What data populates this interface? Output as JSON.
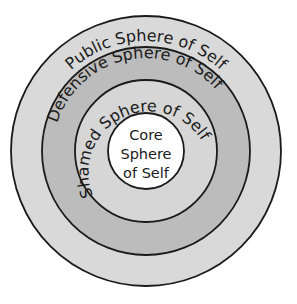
{
  "diagram": {
    "type": "concentric-circles",
    "spheres": [
      {
        "id": "public",
        "label": "Public Sphere of Self",
        "fill": "#d9d9d9"
      },
      {
        "id": "defensive",
        "label": "Defensive Sphere of Self",
        "fill": "#bcbcbc"
      },
      {
        "id": "shamed",
        "label": "Shamed Sphere of Self",
        "fill": "#d6d6d6"
      },
      {
        "id": "core",
        "label_lines": [
          "Core",
          "Sphere",
          "of Self"
        ],
        "fill": "#ffffff"
      }
    ],
    "stroke_color": "#1a1a1a"
  }
}
